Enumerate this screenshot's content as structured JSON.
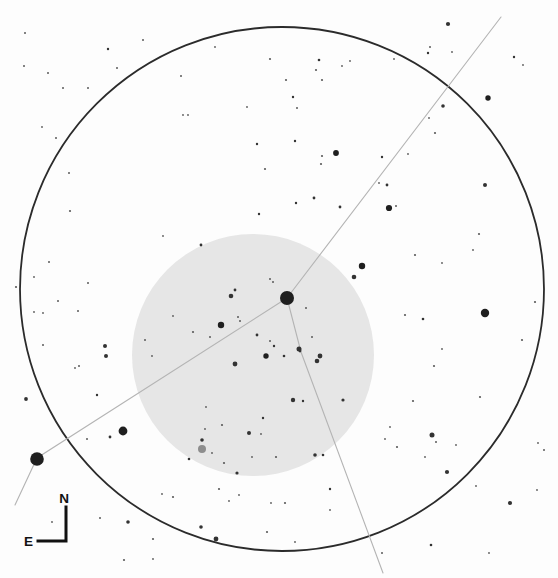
{
  "chart": {
    "type": "star-finder-chart",
    "canvas": {
      "width": 558,
      "height": 578,
      "background": "#fdfdfd"
    },
    "field_circle": {
      "cx": 282,
      "cy": 289,
      "r": 262,
      "stroke": "#2b2b2b",
      "stroke_width": 1.8,
      "fill": "none"
    },
    "eyepiece_circle": {
      "cx": 253,
      "cy": 355,
      "r": 121,
      "fill": "#e6e6e6"
    },
    "constellation_lines": {
      "color": "#b4b4b4",
      "width": 1.1,
      "paths": [
        [
          [
            287,
            298
          ],
          [
            501,
            17
          ]
        ],
        [
          [
            287,
            298
          ],
          [
            37,
            458
          ],
          [
            15,
            505
          ]
        ],
        [
          [
            287,
            298
          ],
          [
            301,
            352
          ],
          [
            383,
            573
          ]
        ]
      ]
    },
    "stars": {
      "color_bright": "#1f1f1f",
      "color_medium": "#333333",
      "color_faint": "#5a5a5a",
      "points": [
        [
          287,
          298,
          7.0
        ],
        [
          37,
          459,
          6.8
        ],
        [
          123,
          431,
          4.4
        ],
        [
          485,
          313,
          4.2
        ],
        [
          362,
          266,
          3.2
        ],
        [
          389,
          208,
          3.1
        ],
        [
          221,
          325,
          3.2
        ],
        [
          336,
          153,
          2.9
        ],
        [
          488,
          98,
          2.7
        ],
        [
          266,
          356,
          2.7
        ],
        [
          299,
          349,
          2.5
        ],
        [
          320,
          356,
          2.4
        ],
        [
          235,
          364,
          2.4
        ],
        [
          216,
          539,
          2.4
        ],
        [
          432,
          435,
          2.5
        ],
        [
          447,
          472,
          2.1
        ],
        [
          510,
          503,
          2.1
        ],
        [
          448,
          24,
          2.1
        ],
        [
          354,
          277,
          2.3
        ],
        [
          231,
          296,
          2.3
        ],
        [
          317,
          361,
          2.3
        ],
        [
          443,
          106,
          1.8
        ],
        [
          485,
          185,
          2.0
        ],
        [
          293,
          400,
          2.2
        ],
        [
          249,
          433,
          2.0
        ],
        [
          128,
          522,
          1.8
        ],
        [
          201,
          527,
          1.8
        ],
        [
          105,
          346,
          2.0
        ],
        [
          106,
          356,
          2.0
        ],
        [
          26,
          399,
          1.9
        ],
        [
          315,
          455,
          1.8
        ],
        [
          343,
          400,
          1.6
        ],
        [
          202,
          440,
          1.8
        ],
        [
          237,
          473,
          1.6
        ],
        [
          25,
          33,
          1.0
        ],
        [
          108,
          49,
          1.2
        ],
        [
          143,
          40,
          1.0
        ],
        [
          24,
          66,
          1.0
        ],
        [
          48,
          73,
          1.0
        ],
        [
          117,
          68,
          1.0
        ],
        [
          63,
          88,
          1.0
        ],
        [
          88,
          88,
          1.0
        ],
        [
          181,
          76,
          1.0
        ],
        [
          42,
          127,
          0.9
        ],
        [
          56,
          138,
          1.0
        ],
        [
          69,
          173,
          1.0
        ],
        [
          183,
          115,
          0.9
        ],
        [
          215,
          47,
          0.9
        ],
        [
          247,
          107,
          0.9
        ],
        [
          188,
          115,
          0.9
        ],
        [
          270,
          59,
          1.1
        ],
        [
          257,
          144,
          1.2
        ],
        [
          319,
          60,
          1.3
        ],
        [
          316,
          70,
          1.1
        ],
        [
          286,
          80,
          1.1
        ],
        [
          322,
          80,
          1.1
        ],
        [
          293,
          97,
          1.2
        ],
        [
          297,
          108,
          1.0
        ],
        [
          350,
          61,
          0.9
        ],
        [
          342,
          66,
          0.9
        ],
        [
          295,
          141,
          1.2
        ],
        [
          322,
          156,
          1.1
        ],
        [
          321,
          164,
          1.1
        ],
        [
          265,
          169,
          1.1
        ],
        [
          428,
          53,
          1.2
        ],
        [
          452,
          52,
          0.9
        ],
        [
          430,
          47,
          1.0
        ],
        [
          394,
          59,
          0.9
        ],
        [
          514,
          57,
          1.2
        ],
        [
          523,
          65,
          0.9
        ],
        [
          429,
          118,
          0.9
        ],
        [
          435,
          133,
          1.1
        ],
        [
          408,
          154,
          0.9
        ],
        [
          382,
          157,
          1.2
        ],
        [
          387,
          185,
          1.4
        ],
        [
          379,
          183,
          0.9
        ],
        [
          70,
          211,
          1.1
        ],
        [
          49,
          262,
          1.0
        ],
        [
          16,
          287,
          1.1
        ],
        [
          34,
          277,
          0.9
        ],
        [
          88,
          283,
          1.0
        ],
        [
          58,
          301,
          1.0
        ],
        [
          78,
          311,
          1.0
        ],
        [
          43,
          313,
          0.9
        ],
        [
          34,
          312,
          0.9
        ],
        [
          163,
          236,
          0.9
        ],
        [
          173,
          316,
          0.9
        ],
        [
          145,
          340,
          1.0
        ],
        [
          152,
          356,
          0.9
        ],
        [
          43,
          345,
          1.0
        ],
        [
          79,
          366,
          1.0
        ],
        [
          75,
          368,
          0.9
        ],
        [
          201,
          245,
          1.4
        ],
        [
          259,
          214,
          1.2
        ],
        [
          296,
          203,
          1.2
        ],
        [
          314,
          198,
          1.4
        ],
        [
          340,
          207,
          1.4
        ],
        [
          235,
          290,
          1.4
        ],
        [
          270,
          279,
          1.0
        ],
        [
          273,
          282,
          1.0
        ],
        [
          193,
          332,
          1.1
        ],
        [
          210,
          337,
          1.0
        ],
        [
          238,
          317,
          1.0
        ],
        [
          240,
          321,
          1.0
        ],
        [
          257,
          335,
          1.4
        ],
        [
          270,
          341,
          1.0
        ],
        [
          274,
          346,
          1.2
        ],
        [
          284,
          356,
          1.3
        ],
        [
          306,
          308,
          1.0
        ],
        [
          312,
          337,
          1.0
        ],
        [
          300,
          351,
          1.4
        ],
        [
          396,
          206,
          1.0
        ],
        [
          415,
          255,
          1.1
        ],
        [
          442,
          263,
          0.9
        ],
        [
          479,
          234,
          1.1
        ],
        [
          473,
          250,
          0.9
        ],
        [
          535,
          302,
          1.1
        ],
        [
          405,
          315,
          1.1
        ],
        [
          423,
          319,
          1.3
        ],
        [
          522,
          340,
          1.1
        ],
        [
          434,
          366,
          1.1
        ],
        [
          442,
          349,
          0.9
        ],
        [
          97,
          395,
          1.2
        ],
        [
          110,
          437,
          1.4
        ],
        [
          87,
          439,
          1.0
        ],
        [
          52,
          522,
          0.9
        ],
        [
          100,
          518,
          1.0
        ],
        [
          153,
          539,
          1.1
        ],
        [
          124,
          560,
          1.1
        ],
        [
          153,
          559,
          0.9
        ],
        [
          173,
          497,
          1.1
        ],
        [
          162,
          494,
          0.9
        ],
        [
          189,
          459,
          1.3
        ],
        [
          212,
          453,
          0.9
        ],
        [
          205,
          429,
          0.9
        ],
        [
          222,
          425,
          1.1
        ],
        [
          224,
          463,
          1.1
        ],
        [
          263,
          418,
          1.2
        ],
        [
          261,
          434,
          0.9
        ],
        [
          276,
          457,
          1.1
        ],
        [
          252,
          457,
          0.9
        ],
        [
          303,
          401,
          1.2
        ],
        [
          206,
          407,
          0.9
        ],
        [
          323,
          455,
          1.3
        ],
        [
          219,
          489,
          1.1
        ],
        [
          229,
          501,
          0.9
        ],
        [
          239,
          495,
          0.9
        ],
        [
          271,
          503,
          0.9
        ],
        [
          285,
          503,
          1.1
        ],
        [
          330,
          489,
          1.2
        ],
        [
          330,
          510,
          0.9
        ],
        [
          267,
          532,
          1.1
        ],
        [
          295,
          542,
          0.9
        ],
        [
          413,
          401,
          1.1
        ],
        [
          480,
          397,
          1.1
        ],
        [
          390,
          427,
          0.9
        ],
        [
          385,
          439,
          0.9
        ],
        [
          397,
          447,
          1.1
        ],
        [
          425,
          457,
          0.9
        ],
        [
          456,
          445,
          0.9
        ],
        [
          436,
          442,
          1.0
        ],
        [
          476,
          486,
          0.9
        ],
        [
          538,
          443,
          0.9
        ],
        [
          544,
          450,
          1.0
        ],
        [
          537,
          490,
          0.9
        ],
        [
          431,
          545,
          1.3
        ],
        [
          489,
          553,
          0.9
        ],
        [
          382,
          553,
          1.0
        ]
      ]
    },
    "special_star": {
      "x": 202,
      "y": 449,
      "r": 4.0,
      "color": "#8d8d8d"
    },
    "compass": {
      "north_label": "N",
      "east_label": "E",
      "color": "#111111",
      "stroke_width": 3,
      "corner": [
        66,
        541
      ],
      "north_tip": [
        66,
        507
      ],
      "east_tip": [
        38,
        541
      ],
      "north_label_pos": [
        64,
        503
      ],
      "east_label_pos": [
        33,
        546
      ],
      "font_size": 13.5
    }
  }
}
